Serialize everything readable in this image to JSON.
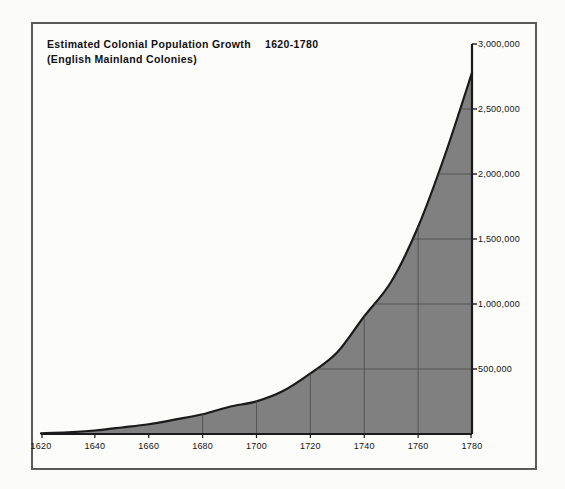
{
  "chart_data": {
    "type": "area",
    "title_line1_main": "Estimated Colonial Population Growth",
    "title_line1_range": "1620-1780",
    "title_line2": "(English Mainland Colonies)",
    "subtitle": "(English Mainland Colonies)",
    "xlabel": "",
    "ylabel": "",
    "xlim": [
      1620,
      1780
    ],
    "ylim": [
      0,
      3000000
    ],
    "grid": true,
    "legend": "none",
    "y_axis_position": "right",
    "fill_color": "#808080",
    "line_color": "#1a1a1a",
    "frame_color": "#5a5a5a",
    "background_color": "#fbfbfa",
    "x_ticks": [
      1620,
      1640,
      1660,
      1680,
      1700,
      1720,
      1740,
      1760,
      1780
    ],
    "x_tick_labels": [
      "1620",
      "1640",
      "1660",
      "1680",
      "1700",
      "1720",
      "1740",
      "1760",
      "1780"
    ],
    "y_ticks": [
      500000,
      1000000,
      1500000,
      2000000,
      2500000,
      3000000
    ],
    "y_tick_labels": [
      "500,000",
      "1,000,000",
      "1,500,000",
      "2,000,000",
      "2,500,000",
      "3,000,000"
    ],
    "gridlines_x": [
      1680,
      1700,
      1720,
      1740,
      1760,
      1780
    ],
    "gridlines_y": [
      500000,
      1000000,
      1500000,
      2000000,
      2500000
    ],
    "x": [
      1620,
      1630,
      1640,
      1650,
      1660,
      1670,
      1680,
      1690,
      1700,
      1710,
      1720,
      1730,
      1740,
      1750,
      1760,
      1770,
      1780
    ],
    "values": [
      5000,
      12000,
      27000,
      50000,
      75000,
      112000,
      152000,
      210000,
      251000,
      332000,
      466000,
      629000,
      906000,
      1171000,
      1594000,
      2148000,
      2780000
    ],
    "series": [
      {
        "name": "Estimated colonial population",
        "values": [
          5000,
          12000,
          27000,
          50000,
          75000,
          112000,
          152000,
          210000,
          251000,
          332000,
          466000,
          629000,
          906000,
          1171000,
          1594000,
          2148000,
          2780000
        ]
      }
    ]
  }
}
